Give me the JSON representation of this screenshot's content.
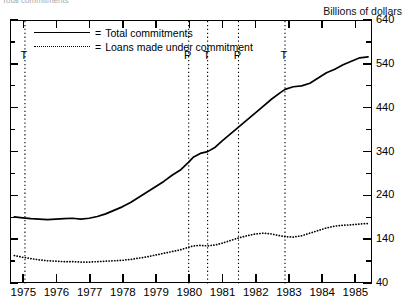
{
  "clipped_title": "Total commitments",
  "unit_caption": "Billions of dollars",
  "legend": {
    "equals": "=",
    "items": [
      {
        "label": "Total commitments",
        "style": "solid",
        "key": "total-commitments"
      },
      {
        "label": "Loans made under commitment",
        "style": "dotted",
        "key": "loans-made-under-commitment"
      }
    ]
  },
  "cycle_markers": [
    {
      "label": "T",
      "x": 1975.02
    },
    {
      "label": "P",
      "x": 1979.95
    },
    {
      "label": "T",
      "x": 1980.52
    },
    {
      "label": "P",
      "x": 1981.45
    },
    {
      "label": "T",
      "x": 1982.85
    }
  ],
  "chart_data": {
    "type": "line",
    "title": "Total commitments",
    "xlabel": "",
    "ylabel": "Billions of dollars",
    "xlim": [
      1974.6,
      1985.5
    ],
    "ylim": [
      40,
      640
    ],
    "ytick_step": 100,
    "yminor_step": 50,
    "grid": false,
    "legend_position": "top-left",
    "yticks": [
      640,
      540,
      440,
      340,
      240,
      140,
      40
    ],
    "xticks": [
      1975,
      1976,
      1977,
      1978,
      1979,
      1980,
      1981,
      1982,
      1983,
      1984,
      1985
    ],
    "xtick_labels": [
      "1975",
      "1976",
      "1977",
      "1978",
      "1979",
      "1980",
      "1981",
      "1982",
      "1983",
      "1984",
      "1985"
    ],
    "annotations": [
      {
        "text": "T",
        "x": 1975.02,
        "kind": "trough"
      },
      {
        "text": "P",
        "x": 1979.95,
        "kind": "peak"
      },
      {
        "text": "T",
        "x": 1980.52,
        "kind": "trough"
      },
      {
        "text": "P",
        "x": 1981.45,
        "kind": "peak"
      },
      {
        "text": "T",
        "x": 1982.85,
        "kind": "trough"
      }
    ],
    "series": [
      {
        "name": "Total commitments",
        "style": "solid",
        "x": [
          1974.7,
          1974.95,
          1975.2,
          1975.45,
          1975.7,
          1975.95,
          1976.2,
          1976.45,
          1976.7,
          1976.95,
          1977.2,
          1977.45,
          1977.7,
          1977.95,
          1978.2,
          1978.45,
          1978.7,
          1978.95,
          1979.2,
          1979.45,
          1979.7,
          1979.95,
          1980.1,
          1980.3,
          1980.52,
          1980.75,
          1980.95,
          1981.2,
          1981.45,
          1981.7,
          1981.95,
          1982.2,
          1982.45,
          1982.7,
          1982.85,
          1983.1,
          1983.35,
          1983.6,
          1983.85,
          1984.1,
          1984.35,
          1984.6,
          1984.85,
          1985.1,
          1985.35
        ],
        "values": [
          193,
          191,
          189,
          188,
          187,
          188,
          189,
          190,
          188,
          190,
          194,
          200,
          208,
          216,
          226,
          238,
          250,
          262,
          274,
          288,
          300,
          318,
          330,
          338,
          342,
          352,
          366,
          382,
          398,
          414,
          430,
          446,
          462,
          476,
          484,
          490,
          492,
          498,
          510,
          522,
          530,
          540,
          548,
          556,
          558
        ]
      },
      {
        "name": "Loans made under commitment",
        "style": "dotted",
        "x": [
          1974.7,
          1974.95,
          1975.2,
          1975.45,
          1975.7,
          1975.95,
          1976.2,
          1976.45,
          1976.7,
          1976.95,
          1977.2,
          1977.45,
          1977.7,
          1977.95,
          1978.2,
          1978.45,
          1978.7,
          1978.95,
          1979.2,
          1979.45,
          1979.7,
          1979.95,
          1980.1,
          1980.3,
          1980.52,
          1980.75,
          1980.95,
          1981.2,
          1981.45,
          1981.7,
          1981.95,
          1982.2,
          1982.45,
          1982.7,
          1982.85,
          1983.1,
          1983.35,
          1983.6,
          1983.85,
          1984.1,
          1984.35,
          1984.6,
          1984.85,
          1985.1,
          1985.35
        ],
        "values": [
          105,
          101,
          98,
          95,
          93,
          92,
          91,
          91,
          90,
          90,
          91,
          92,
          93,
          94,
          96,
          99,
          102,
          106,
          110,
          114,
          118,
          124,
          127,
          128,
          127,
          129,
          133,
          139,
          145,
          150,
          154,
          156,
          154,
          150,
          148,
          147,
          150,
          156,
          162,
          168,
          172,
          174,
          175,
          177,
          178
        ]
      }
    ]
  }
}
